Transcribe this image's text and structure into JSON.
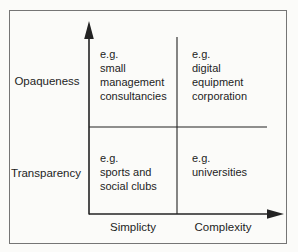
{
  "figure": {
    "type": "2x2-matrix-diagram",
    "background": "#fbfbf9",
    "border_color": "#757575",
    "line_color": "#232323",
    "text_color": "#1d1d1d"
  },
  "y_axis": {
    "top_label": "Opaqueness",
    "bottom_label": "Transparency"
  },
  "x_axis": {
    "left_label": "Simplicty",
    "right_label": "Complexity"
  },
  "quadrants": {
    "top_left": "e.g.\nsmall\nmanagement\nconsultancies",
    "top_right": "e.g.\ndigital\nequipment\ncorporation",
    "bottom_left": "e.g.\nsports and\nsocial clubs",
    "bottom_right": "e.g.\nuniversities"
  },
  "icons": {
    "y_axis_arrowhead": "up-arrow",
    "x_axis_arrowhead": "right-arrow"
  }
}
